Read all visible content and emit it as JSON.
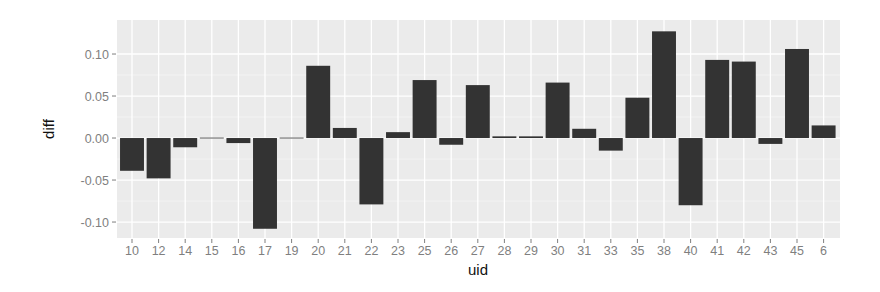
{
  "chart_data": {
    "type": "bar",
    "title": "",
    "xlabel": "uid",
    "ylabel": "diff",
    "categories": [
      "10",
      "12",
      "14",
      "15",
      "16",
      "17",
      "19",
      "20",
      "21",
      "22",
      "23",
      "25",
      "26",
      "27",
      "28",
      "29",
      "30",
      "31",
      "33",
      "35",
      "38",
      "40",
      "41",
      "42",
      "43",
      "45",
      "6"
    ],
    "values": [
      -0.039,
      -0.048,
      -0.011,
      -0.0005,
      -0.006,
      -0.108,
      -0.0005,
      0.086,
      0.012,
      -0.079,
      0.007,
      0.069,
      -0.008,
      0.063,
      0.002,
      0.002,
      0.066,
      0.011,
      -0.015,
      0.048,
      0.127,
      -0.08,
      0.093,
      0.091,
      -0.007,
      0.106,
      0.015
    ],
    "yticks": [
      0.1,
      0.05,
      0.0,
      -0.05,
      -0.1
    ],
    "ytick_labels": [
      "0.10",
      "0.05",
      "0.00",
      "-0.05",
      "-0.10"
    ],
    "ylim": [
      -0.119,
      0.1405
    ],
    "grid": true,
    "legend": null,
    "colors": {
      "panel_bg": "#ebebeb",
      "grid_major": "#ffffff",
      "grid_minor": "#f5f5f5",
      "bar_fill": "#333333",
      "tick_label": "#7f7f7f",
      "tick_mark": "#7f7f7f",
      "axis_title": "#111111"
    }
  }
}
